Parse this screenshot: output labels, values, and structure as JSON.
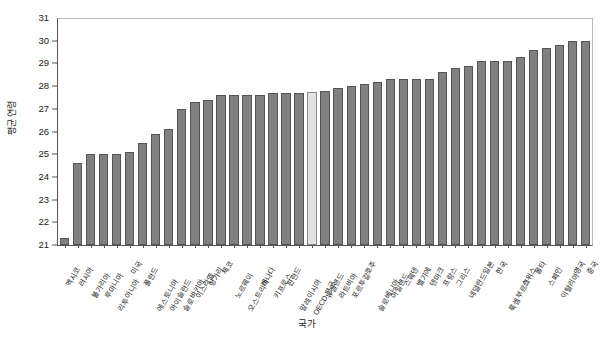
{
  "chart_data": {
    "type": "bar",
    "title": "",
    "xlabel": "국가",
    "ylabel": "평균 연령",
    "ylim": [
      21,
      31
    ],
    "ytick_step": 1,
    "yticks": [
      21,
      22,
      23,
      24,
      25,
      26,
      27,
      28,
      29,
      30,
      31
    ],
    "grid": false,
    "legend": "none",
    "bar_color": "#808080",
    "bar_edge_color": "#555555",
    "highlight_color": "#e2e2e2",
    "highlight_edge_color": "#8a8a8a",
    "highlight_category": "OECD 평균",
    "categories": [
      "멕시코",
      "러시아",
      "불가리아",
      "루마니아",
      "리투아니아",
      "미국",
      "폴란드",
      "에스토니아",
      "아이슬란드",
      "슬로바키아",
      "이스라엘",
      "헝가리",
      "체코",
      "노르웨이",
      "오스트리아",
      "캐나다",
      "키프로스",
      "핀란드",
      "말레이시아",
      "OECD 평균",
      "뉴질랜드",
      "라트비아",
      "포르투갈",
      "호주",
      "슬로베니아",
      "아일랜드",
      "스웨덴",
      "벨기에",
      "덴마크",
      "프랑스",
      "그리스",
      "네덜란드",
      "일본",
      "한국",
      "룩셈부르크",
      "스위스",
      "몰타",
      "스페인",
      "이탈리아",
      "영국",
      "중국"
    ],
    "values": [
      21.3,
      24.6,
      25.0,
      25.0,
      25.0,
      25.1,
      25.5,
      25.9,
      26.1,
      27.0,
      27.3,
      27.4,
      27.6,
      27.6,
      27.6,
      27.6,
      27.7,
      27.7,
      27.7,
      27.75,
      27.8,
      27.9,
      28.0,
      28.1,
      28.2,
      28.3,
      28.3,
      28.3,
      28.3,
      28.6,
      28.8,
      28.9,
      29.1,
      29.1,
      29.1,
      29.3,
      29.6,
      29.7,
      29.8,
      30.0,
      30.0
    ]
  }
}
